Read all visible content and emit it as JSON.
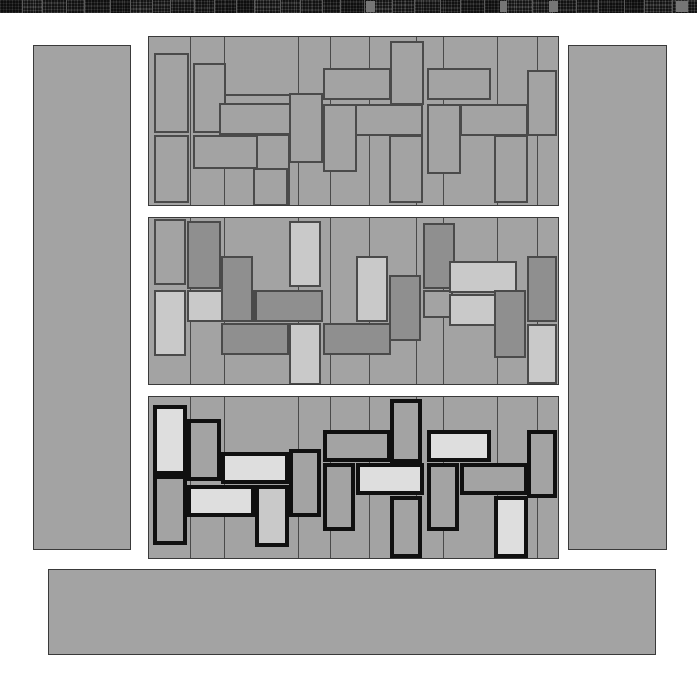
{
  "page": {
    "width": 697,
    "height": 685,
    "background": "#ffffff"
  },
  "colors": {
    "page_background": "#ffffff",
    "block_fill": "#a3a3a3",
    "block_stroke": "#3a3a3a",
    "tile_stroke_thin": "#4a4a4a",
    "tile_stroke_thick": "#101010",
    "fill_base": "#a3a3a3",
    "fill_light": "#c9c9c9",
    "fill_lighter": "#dedede",
    "fill_dark": "#8f8f8f",
    "filmstrip_background": "#191919",
    "filmstrip_cell": "#232323",
    "filmstrip_separator": "#5b5b5b",
    "filmstrip_highlight": "#767676"
  },
  "filmstrip": {
    "name": "thumbnail-filmstrip",
    "x": 0,
    "y": 0,
    "width": 697,
    "height": 13,
    "cells": [
      {
        "x": 0,
        "w": 22
      },
      {
        "x": 22,
        "w": 20
      },
      {
        "x": 42,
        "w": 24
      },
      {
        "x": 66,
        "w": 18
      },
      {
        "x": 84,
        "w": 26
      },
      {
        "x": 110,
        "w": 20
      },
      {
        "x": 130,
        "w": 22
      },
      {
        "x": 152,
        "w": 18
      },
      {
        "x": 170,
        "w": 24
      },
      {
        "x": 194,
        "w": 20
      },
      {
        "x": 214,
        "w": 22
      },
      {
        "x": 236,
        "w": 18
      },
      {
        "x": 254,
        "w": 26
      },
      {
        "x": 280,
        "w": 20
      },
      {
        "x": 300,
        "w": 22
      },
      {
        "x": 322,
        "w": 18
      },
      {
        "x": 340,
        "w": 24
      },
      {
        "x": 364,
        "w": 28
      },
      {
        "x": 392,
        "w": 22
      },
      {
        "x": 414,
        "w": 26
      },
      {
        "x": 440,
        "w": 20
      },
      {
        "x": 460,
        "w": 24
      },
      {
        "x": 484,
        "w": 22
      },
      {
        "x": 506,
        "w": 26
      },
      {
        "x": 532,
        "w": 20
      },
      {
        "x": 552,
        "w": 24
      },
      {
        "x": 576,
        "w": 22
      },
      {
        "x": 598,
        "w": 26
      },
      {
        "x": 624,
        "w": 20
      },
      {
        "x": 644,
        "w": 28
      },
      {
        "x": 672,
        "w": 25
      }
    ],
    "separators": [
      22,
      42,
      66,
      84,
      110,
      130,
      152,
      170,
      194,
      214,
      236,
      254,
      280,
      300,
      322,
      340,
      364,
      392,
      414,
      440,
      460,
      484,
      506,
      532,
      552,
      576,
      598,
      624,
      644,
      672
    ],
    "highlights": [
      {
        "x": 366,
        "w": 9
      },
      {
        "x": 500,
        "w": 7
      },
      {
        "x": 549,
        "w": 9
      },
      {
        "x": 676,
        "w": 12
      }
    ]
  },
  "blocks": [
    {
      "name": "left-sidebar-block",
      "x": 33,
      "y": 45,
      "w": 98,
      "h": 505
    },
    {
      "name": "right-sidebar-block",
      "x": 568,
      "y": 45,
      "w": 99,
      "h": 505
    },
    {
      "name": "bottom-bar-block",
      "x": 48,
      "y": 569,
      "w": 608,
      "h": 86
    }
  ],
  "panels": [
    {
      "name": "panel-brick-layout-outline",
      "label": "Panel 1 — thin outline, uniform fill",
      "x": 148,
      "y": 36,
      "w": 411,
      "h": 170,
      "style": "thin",
      "columns": [
        0,
        42,
        76,
        150,
        182,
        221,
        268,
        295,
        349,
        389,
        417,
        446,
        479,
        513,
        542
      ],
      "tiles": [
        {
          "x": 5,
          "y": 16,
          "w": 35,
          "h": 80,
          "fill": "#a3a3a3"
        },
        {
          "x": 5,
          "y": 98,
          "w": 35,
          "h": 68,
          "fill": "#a3a3a3"
        },
        {
          "x": 44,
          "y": 26,
          "w": 33,
          "h": 70,
          "fill": "#a3a3a3"
        },
        {
          "x": 44,
          "y": 98,
          "w": 66,
          "h": 34,
          "fill": "#a3a3a3"
        },
        {
          "x": 75,
          "y": 57,
          "w": 67,
          "h": 33,
          "fill": "#a3a3a3"
        },
        {
          "x": 70,
          "y": 66,
          "w": 72,
          "h": 32,
          "fill": "#a3a3a3"
        },
        {
          "x": 107,
          "y": 97,
          "w": 34,
          "h": 72,
          "fill": "#a3a3a3"
        },
        {
          "x": 140,
          "y": 56,
          "w": 34,
          "h": 70,
          "fill": "#a3a3a3"
        },
        {
          "x": 174,
          "y": 31,
          "w": 68,
          "h": 32,
          "fill": "#a3a3a3"
        },
        {
          "x": 174,
          "y": 67,
          "w": 34,
          "h": 68,
          "fill": "#a3a3a3"
        },
        {
          "x": 206,
          "y": 67,
          "w": 68,
          "h": 32,
          "fill": "#a3a3a3"
        },
        {
          "x": 241,
          "y": 4,
          "w": 34,
          "h": 64,
          "fill": "#a3a3a3"
        },
        {
          "x": 240,
          "y": 98,
          "w": 34,
          "h": 68,
          "fill": "#a3a3a3"
        },
        {
          "x": 278,
          "y": 31,
          "w": 64,
          "h": 32,
          "fill": "#a3a3a3"
        },
        {
          "x": 278,
          "y": 67,
          "w": 34,
          "h": 70,
          "fill": "#a3a3a3"
        },
        {
          "x": 311,
          "y": 67,
          "w": 68,
          "h": 32,
          "fill": "#a3a3a3"
        },
        {
          "x": 345,
          "y": 98,
          "w": 34,
          "h": 68,
          "fill": "#a3a3a3"
        },
        {
          "x": 378,
          "y": 33,
          "w": 30,
          "h": 66,
          "fill": "#a3a3a3"
        },
        {
          "x": 104,
          "y": 131,
          "w": 35,
          "h": 38,
          "fill": "#a3a3a3"
        }
      ]
    },
    {
      "name": "panel-brick-layout-shaded",
      "label": "Panel 2 — thin outline, varied fills",
      "x": 148,
      "y": 217,
      "w": 411,
      "h": 168,
      "style": "thin",
      "columns": [
        0,
        42,
        76,
        150,
        182,
        221,
        268,
        295,
        349,
        389,
        417,
        446,
        479,
        513,
        542
      ],
      "tiles": [
        {
          "x": 5,
          "y": 1,
          "w": 32,
          "h": 66,
          "fill": "#a3a3a3"
        },
        {
          "x": 5,
          "y": 72,
          "w": 32,
          "h": 66,
          "fill": "#c9c9c9"
        },
        {
          "x": 38,
          "y": 3,
          "w": 34,
          "h": 68,
          "fill": "#8f8f8f"
        },
        {
          "x": 38,
          "y": 72,
          "w": 68,
          "h": 32,
          "fill": "#c9c9c9"
        },
        {
          "x": 72,
          "y": 105,
          "w": 68,
          "h": 32,
          "fill": "#8f8f8f"
        },
        {
          "x": 72,
          "y": 38,
          "w": 32,
          "h": 66,
          "fill": "#8f8f8f"
        },
        {
          "x": 106,
          "y": 72,
          "w": 68,
          "h": 32,
          "fill": "#8f8f8f"
        },
        {
          "x": 140,
          "y": 3,
          "w": 32,
          "h": 66,
          "fill": "#c9c9c9"
        },
        {
          "x": 140,
          "y": 105,
          "w": 32,
          "h": 62,
          "fill": "#c9c9c9"
        },
        {
          "x": 174,
          "y": 105,
          "w": 68,
          "h": 32,
          "fill": "#8f8f8f"
        },
        {
          "x": 207,
          "y": 38,
          "w": 32,
          "h": 66,
          "fill": "#c9c9c9"
        },
        {
          "x": 240,
          "y": 57,
          "w": 32,
          "h": 66,
          "fill": "#8f8f8f"
        },
        {
          "x": 274,
          "y": 5,
          "w": 32,
          "h": 66,
          "fill": "#8f8f8f"
        },
        {
          "x": 274,
          "y": 72,
          "w": 30,
          "h": 28,
          "fill": "#a3a3a3"
        },
        {
          "x": 300,
          "y": 43,
          "w": 68,
          "h": 32,
          "fill": "#c9c9c9"
        },
        {
          "x": 300,
          "y": 76,
          "w": 68,
          "h": 32,
          "fill": "#c9c9c9"
        },
        {
          "x": 345,
          "y": 72,
          "w": 32,
          "h": 68,
          "fill": "#8f8f8f"
        },
        {
          "x": 378,
          "y": 38,
          "w": 30,
          "h": 66,
          "fill": "#8f8f8f"
        },
        {
          "x": 378,
          "y": 106,
          "w": 30,
          "h": 60,
          "fill": "#c9c9c9"
        }
      ]
    },
    {
      "name": "panel-brick-layout-bold",
      "label": "Panel 3 — thick black outline, high contrast fills",
      "x": 148,
      "y": 396,
      "w": 411,
      "h": 163,
      "style": "thick",
      "columns": [
        0,
        42,
        76,
        150,
        182,
        221,
        268,
        295,
        349,
        389,
        417,
        446,
        479,
        513,
        542
      ],
      "tiles": [
        {
          "x": 4,
          "y": 8,
          "w": 34,
          "h": 70,
          "fill": "#dedede"
        },
        {
          "x": 4,
          "y": 78,
          "w": 34,
          "h": 70,
          "fill": "#a3a3a3"
        },
        {
          "x": 38,
          "y": 22,
          "w": 34,
          "h": 62,
          "fill": "#a3a3a3"
        },
        {
          "x": 38,
          "y": 88,
          "w": 68,
          "h": 32,
          "fill": "#dedede"
        },
        {
          "x": 72,
          "y": 55,
          "w": 68,
          "h": 32,
          "fill": "#dedede"
        },
        {
          "x": 106,
          "y": 88,
          "w": 34,
          "h": 62,
          "fill": "#c9c9c9"
        },
        {
          "x": 140,
          "y": 52,
          "w": 32,
          "h": 68,
          "fill": "#a3a3a3"
        },
        {
          "x": 174,
          "y": 33,
          "w": 68,
          "h": 32,
          "fill": "#a3a3a3"
        },
        {
          "x": 174,
          "y": 66,
          "w": 32,
          "h": 68,
          "fill": "#a3a3a3"
        },
        {
          "x": 207,
          "y": 66,
          "w": 68,
          "h": 32,
          "fill": "#dedede"
        },
        {
          "x": 241,
          "y": 2,
          "w": 32,
          "h": 64,
          "fill": "#a3a3a3"
        },
        {
          "x": 241,
          "y": 99,
          "w": 32,
          "h": 62,
          "fill": "#a3a3a3"
        },
        {
          "x": 278,
          "y": 33,
          "w": 64,
          "h": 32,
          "fill": "#dedede"
        },
        {
          "x": 278,
          "y": 66,
          "w": 32,
          "h": 68,
          "fill": "#a3a3a3"
        },
        {
          "x": 311,
          "y": 66,
          "w": 68,
          "h": 32,
          "fill": "#a3a3a3"
        },
        {
          "x": 345,
          "y": 99,
          "w": 34,
          "h": 62,
          "fill": "#dedede"
        },
        {
          "x": 378,
          "y": 33,
          "w": 30,
          "h": 68,
          "fill": "#a3a3a3"
        }
      ]
    }
  ]
}
